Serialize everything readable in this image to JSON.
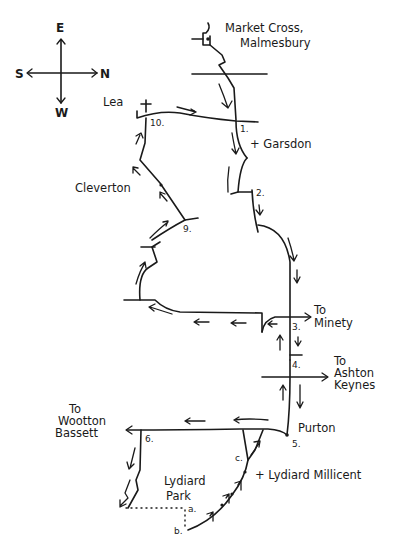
{
  "compass": {
    "east": "E",
    "west": "W",
    "south": "S",
    "north": "N"
  },
  "places": {
    "start": "Market Cross,",
    "start_line2": "Malmesbury",
    "garsdon": "+ Garsdon",
    "lea": "Lea",
    "cleverton": "Cleverton",
    "minety_1": "To",
    "minety_2": "Minety",
    "ashton_1": "To",
    "ashton_2": "Ashton",
    "ashton_3": "Keynes",
    "purton": "Purton",
    "wootton_1": "To",
    "wootton_2": "Wootton",
    "wootton_3": "Bassett",
    "lydiard_park_1": "Lydiard",
    "lydiard_park_2": "Park",
    "lydiard_millicent": "+ Lydiard Millicent"
  },
  "waypoints": [
    "1.",
    "2.",
    "3.",
    "4.",
    "5.",
    "6.",
    "9.",
    "10.",
    "a.",
    "b.",
    "c."
  ],
  "colors": {
    "ink": "#1a1a1a",
    "paper": "#ffffff"
  }
}
